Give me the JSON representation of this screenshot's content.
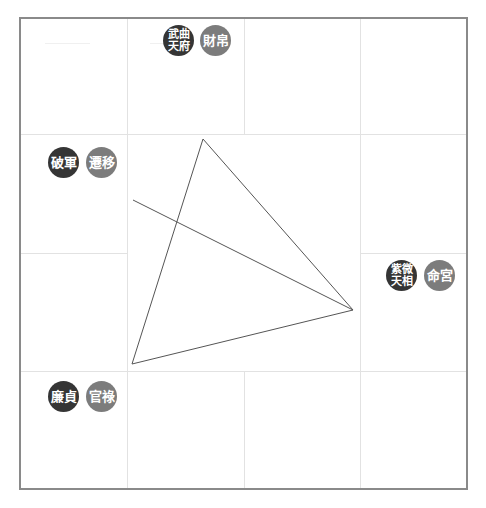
{
  "chart": {
    "palaces": [
      {
        "id": "caibo",
        "stars": [
          "武曲",
          "天府"
        ],
        "palace": "財帛",
        "cell": "top-row-col2"
      },
      {
        "id": "qianyi",
        "stars": [
          "破軍"
        ],
        "palace": "遷移",
        "cell": "left-col-row2"
      },
      {
        "id": "ming",
        "stars": [
          "紫微",
          "天相"
        ],
        "palace": "命宮",
        "cell": "right-col-row3"
      },
      {
        "id": "guanlu",
        "stars": [
          "廉貞"
        ],
        "palace": "官祿",
        "cell": "left-col-row4"
      }
    ],
    "colors": {
      "frame": "#8a8a8a",
      "grid": "#e2e2e2",
      "star_badge": "#353535",
      "palace_badge": "#7c7c7c",
      "lines": "#555555"
    },
    "triangle": {
      "points": [
        [
          203,
          139
        ],
        [
          353,
          310
        ],
        [
          132,
          364
        ]
      ]
    },
    "opposition_line": {
      "from": [
        133,
        200
      ],
      "to": [
        353,
        310
      ]
    }
  }
}
